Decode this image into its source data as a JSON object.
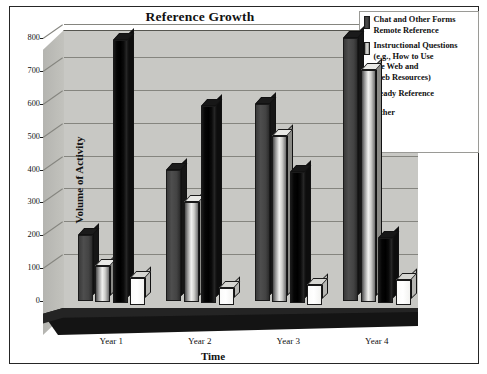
{
  "chart_data": {
    "type": "bar",
    "title": "Reference Growth",
    "xlabel": "Time",
    "ylabel": "Volume of Activity",
    "categories": [
      "Year 1",
      "Year 2",
      "Year 3",
      "Year 4"
    ],
    "ylim": [
      0,
      800
    ],
    "yticks": [
      0,
      100,
      200,
      300,
      400,
      500,
      600,
      700,
      800
    ],
    "ytick_labels": [
      "0",
      "100",
      "200",
      "300",
      "400",
      "500",
      "600",
      "700",
      "800"
    ],
    "grid": true,
    "legend_position": "top-right",
    "style": "3d-column",
    "series": [
      {
        "name": "Chat and Other Forms Remote Reference",
        "color": "#434343",
        "values": [
          200,
          400,
          600,
          800
        ]
      },
      {
        "name": "Instructional Questions (e.g., How to Use the Web and Web Resources)",
        "color": "#d9d9d6",
        "values": [
          110,
          305,
          505,
          705
        ]
      },
      {
        "name": "Ready Reference",
        "color": "#000000",
        "values": [
          800,
          600,
          400,
          200
        ]
      },
      {
        "name": "Other",
        "color": "#ffffff",
        "values": [
          80,
          50,
          60,
          75
        ]
      }
    ]
  },
  "legend": {
    "entries": [
      {
        "label": "Chat and Other Forms\nRemote Reference",
        "swatch": "swatch-dark-gray"
      },
      {
        "label": "Instructional Questions\n(e.g., How to Use\nthe Web and\nWeb Resources)",
        "swatch": "swatch-light-gray"
      },
      {
        "label": "Ready Reference",
        "swatch": "swatch-black"
      },
      {
        "label": "Other",
        "swatch": "swatch-white"
      }
    ]
  }
}
